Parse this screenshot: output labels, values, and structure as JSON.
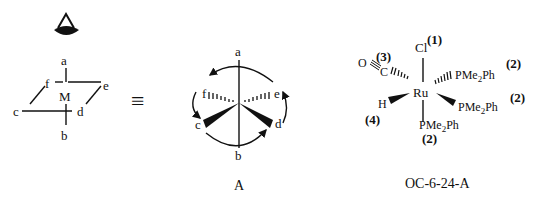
{
  "left_diagram": {
    "eye_icon": "eye-viewpoint",
    "center": "M",
    "labels": {
      "a": "a",
      "b": "b",
      "c": "c",
      "d": "d",
      "e": "e",
      "f": "f"
    }
  },
  "equivalence_symbol": "≡",
  "middle_diagram": {
    "labels": {
      "a": "a",
      "b": "b",
      "c": "c",
      "d": "d",
      "e": "e",
      "f": "f"
    },
    "caption": "A"
  },
  "right_diagram": {
    "center": "Ru",
    "ligands": {
      "top": {
        "atom": "Cl",
        "priority": "(1)"
      },
      "carbonyl_o": "O",
      "carbonyl_c": "C",
      "carbonyl_priority": "(3)",
      "right_upper": {
        "text_main": "PMe",
        "sub": "2",
        "text_end": "Ph",
        "priority": "(2)"
      },
      "right_lower": {
        "text_main": "PMe",
        "sub": "2",
        "text_end": "Ph",
        "priority": "(2)"
      },
      "hydride": {
        "atom": "H",
        "priority": "(4)"
      },
      "bottom": {
        "text_main": "PMe",
        "sub": "2",
        "text_end": "Ph",
        "priority": "(2)"
      }
    },
    "caption": "OC-6-24-A"
  }
}
